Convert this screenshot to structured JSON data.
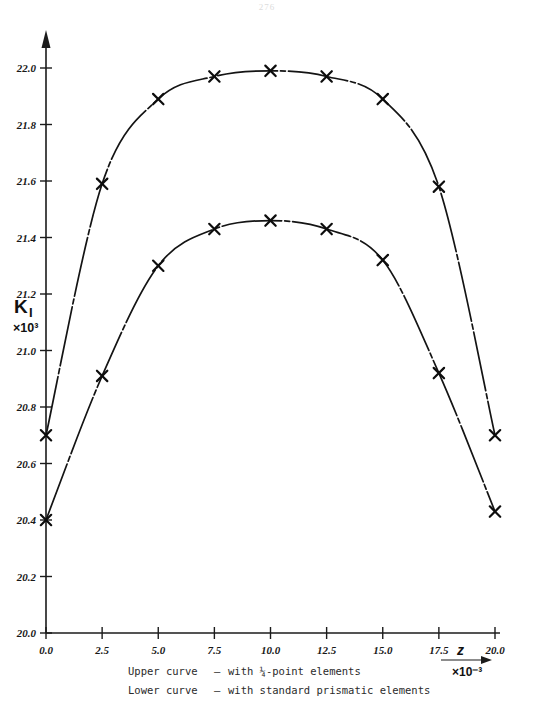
{
  "page": {
    "number": "276"
  },
  "chart_data": {
    "type": "line",
    "title": "",
    "xlabel": "z",
    "xlabel_scale": "×10⁻³",
    "ylabel": "K",
    "ylabel_subscript": "I",
    "ylabel_scale": "×10³",
    "xlim": [
      0.0,
      20.0
    ],
    "ylim": [
      20.0,
      22.0
    ],
    "grid": false,
    "legend_position": "below-axis",
    "xticks": [
      "0.0",
      "2.5",
      "5.0",
      "7.5",
      "10.0",
      "12.5",
      "15.0",
      "17.5",
      "20.0"
    ],
    "xtick_values": [
      0.0,
      2.5,
      5.0,
      7.5,
      10.0,
      12.5,
      15.0,
      17.5,
      20.0
    ],
    "yticks": [
      "20.0",
      "20.2",
      "20.4",
      "20.6",
      "20.8",
      "21.0",
      "21.2",
      "21.4",
      "21.6",
      "21.8",
      "22.0"
    ],
    "ytick_values": [
      20.0,
      20.2,
      20.4,
      20.6,
      20.8,
      21.0,
      21.2,
      21.4,
      21.6,
      21.8,
      22.0
    ],
    "marker_style": "x-cross",
    "line_style": "dash-dot",
    "x": [
      0.0,
      2.5,
      5.0,
      7.5,
      10.0,
      12.5,
      15.0,
      17.5,
      20.0
    ],
    "series": [
      {
        "name": "Upper curve",
        "description": "with 1/4-point elements",
        "values": [
          20.7,
          21.59,
          21.89,
          21.97,
          21.99,
          21.97,
          21.89,
          21.58,
          20.7
        ]
      },
      {
        "name": "Lower curve",
        "description": "with standard prismatic elements",
        "values": [
          20.4,
          20.91,
          21.3,
          21.43,
          21.46,
          21.43,
          21.32,
          20.92,
          20.43
        ]
      }
    ]
  },
  "caption": {
    "lines": [
      {
        "label": "Upper curve",
        "dash": "–",
        "text": "with ¼-point elements"
      },
      {
        "label": "Lower curve",
        "dash": "–",
        "text": "with standard prismatic elements"
      }
    ]
  }
}
